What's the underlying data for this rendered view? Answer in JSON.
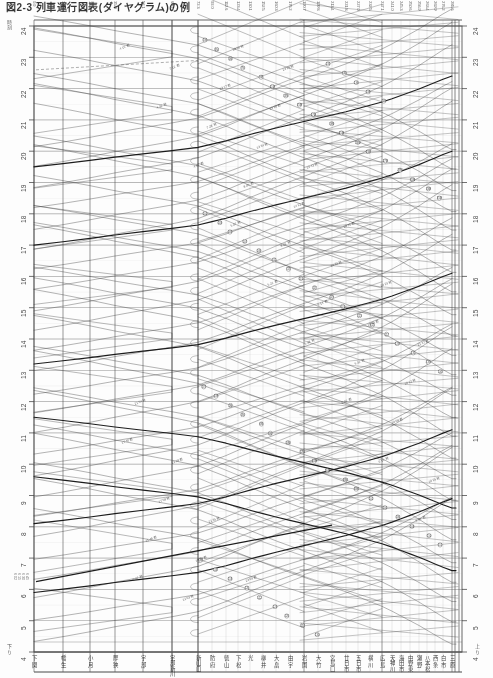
{
  "document": {
    "title": "図2-3  列車運行図表(ダイヤグラム)の例",
    "kind": "railway-train-graph",
    "orientation": "time on vertical axis, stations on horizontal axis"
  },
  "axes": {
    "time_axis": {
      "label": "時刻",
      "unit": "hour",
      "min": 4,
      "max": 24,
      "ticks": [
        4,
        5,
        6,
        7,
        8,
        9,
        10,
        11,
        12,
        13,
        14,
        15,
        16,
        17,
        18,
        19,
        20,
        21,
        22,
        23,
        24
      ],
      "tick_labels": [
        "4",
        "5",
        "6",
        "7",
        "8",
        "9",
        "10",
        "11",
        "12",
        "13",
        "14",
        "15",
        "16",
        "17",
        "18",
        "19",
        "20",
        "21",
        "22",
        "23",
        "24"
      ],
      "left_label_note": "4 下",
      "right_label_note": "4 上",
      "sub_marks": [
        "6 02",
        "6 15",
        "6 30",
        "6 45"
      ]
    },
    "station_axis": {
      "label": "駅",
      "stations": [
        {
          "name": "下関",
          "short": "下 関",
          "km": "0.0",
          "x": 34
        },
        {
          "name": "幡生",
          "short": "幡 生",
          "km": "3.2",
          "x": 63
        },
        {
          "name": "小月",
          "short": "小 月",
          "km": "18.9",
          "x": 90
        },
        {
          "name": "厚狭",
          "short": "厚 狭",
          "km": "35.0",
          "x": 115
        },
        {
          "name": "宇部",
          "short": "宇 部",
          "km": "52.1",
          "x": 143
        },
        {
          "name": "宇部新川",
          "short": "宇部新川",
          "km": "60.4",
          "x": 172
        },
        {
          "name": "新山口",
          "short": "新山口",
          "km": "72.3",
          "x": 198
        },
        {
          "name": "防府",
          "short": "防 府",
          "km": "92.0",
          "x": 212
        },
        {
          "name": "徳山",
          "short": "徳 山",
          "km": "112.6",
          "x": 226
        },
        {
          "name": "下松",
          "short": "下 松",
          "km": "123.4",
          "x": 238
        },
        {
          "name": "光",
          "short": "光",
          "km": "130.1",
          "x": 250
        },
        {
          "name": "柳井",
          "short": "柳 井",
          "km": "152.5",
          "x": 263
        },
        {
          "name": "大畠",
          "short": "大 畠",
          "km": "160.3",
          "x": 276
        },
        {
          "name": "由宇",
          "short": "由 宇",
          "km": "176.2",
          "x": 290
        },
        {
          "name": "岩国",
          "short": "岩 国",
          "km": "190.7",
          "x": 304
        },
        {
          "name": "大竹",
          "short": "大 竹",
          "km": "199.8",
          "x": 318
        },
        {
          "name": "宮島口",
          "short": "宮島口",
          "km": "213.4",
          "x": 332
        },
        {
          "name": "廿日市",
          "short": "廿日市",
          "km": "221.8",
          "x": 346
        },
        {
          "name": "五日市",
          "short": "五日市",
          "km": "227.0",
          "x": 358
        },
        {
          "name": "横川",
          "short": "横 川",
          "km": "232.5",
          "x": 370
        },
        {
          "name": "広島",
          "short": "広 島",
          "km": "237.1",
          "x": 382
        },
        {
          "name": "天神川",
          "short": "天神川",
          "km": "241.0",
          "x": 392
        },
        {
          "name": "海田市",
          "short": "海田市",
          "km": "245.3",
          "x": 401
        },
        {
          "name": "中野東",
          "short": "中野東",
          "km": "250.6",
          "x": 410
        },
        {
          "name": "瀬野",
          "short": "瀬 野",
          "km": "256.9",
          "x": 419
        },
        {
          "name": "八本松",
          "short": "八本松",
          "km": "263.4",
          "x": 427
        },
        {
          "name": "西条",
          "short": "西 条",
          "km": "269.9",
          "x": 435
        },
        {
          "name": "白市",
          "short": "白 市",
          "km": "276.2",
          "x": 443
        },
        {
          "name": "三原",
          "short": "三 原",
          "km": "285.6",
          "x": 452
        }
      ]
    }
  },
  "legend": {
    "heavy_line": "特急・急行列車",
    "light_line": "普通列車",
    "circle_marker": "列車番号",
    "dashed_line": "回送・臾行"
  },
  "train_numbers": [
    "1M",
    "3M",
    "5M",
    "7M",
    "9M",
    "11M",
    "13M",
    "15M",
    "17M",
    "19M",
    "21M",
    "23M",
    "25M",
    "27M",
    "29M",
    "31M",
    "33M",
    "35M",
    "101",
    "103",
    "105",
    "107",
    "109",
    "111",
    "113",
    "115",
    "117",
    "119",
    "121",
    "123",
    "125",
    "127",
    "129",
    "131",
    "133",
    "135",
    "137",
    "139",
    "2M",
    "4M",
    "6M",
    "8M",
    "10M",
    "12M",
    "14M",
    "16M",
    "18M",
    "20M",
    "102",
    "104",
    "106",
    "108",
    "110",
    "112",
    "114",
    "116",
    "118",
    "120",
    "122",
    "124",
    "126",
    "128",
    "130",
    "132",
    "134",
    "136",
    "138",
    "140"
  ],
  "annotations": {
    "time_marks": [
      "4 15 着",
      "4 32 発",
      "4 52 着",
      "5 07 発",
      "5 21 着",
      "5 38 発",
      "6 02 着",
      "6 15 発",
      "6 31 着",
      "6 47 発",
      "7 12 着",
      "7 28 発",
      "8 05 着",
      "8 22 発",
      "9 14 着",
      "9 31 発",
      "10 08 着",
      "10 25 発",
      "11 46 着",
      "12 03 発",
      "13 17 着",
      "13 34 発",
      "14 22 着",
      "14 39 発",
      "15 55 着",
      "16 12 発",
      "17 40 着",
      "17 58 発",
      "18 33 着",
      "18 50 発",
      "19 26 着",
      "19 43 発",
      "20 11 着",
      "20 29 発",
      "21 37 着",
      "21 54 発",
      "22 18 着",
      "22 35 発",
      "23 09 着",
      "23 26 発"
    ]
  },
  "footer": {
    "left_corner": "下 り",
    "right_corner": "上 り",
    "axis_caption": "駅 名"
  },
  "colors": {
    "grid_major": "#555555",
    "grid_minor": "#999999",
    "train_light": "#3b3b3b",
    "train_heavy": "#111111",
    "paper": "#fdfdfd"
  }
}
